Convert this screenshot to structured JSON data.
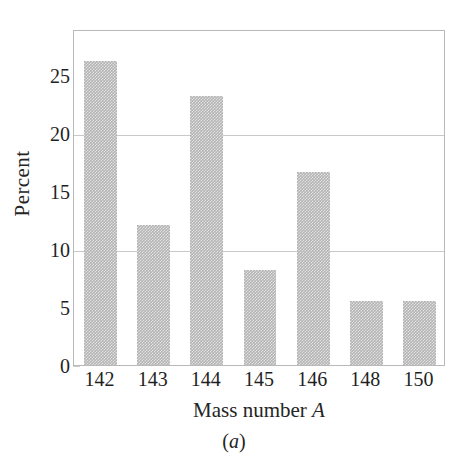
{
  "chart_data": {
    "type": "bar",
    "title": "",
    "subtitle": "",
    "categories": [
      "142",
      "143",
      "144",
      "145",
      "146",
      "148",
      "150"
    ],
    "values": [
      26.2,
      12.1,
      23.2,
      8.2,
      16.7,
      5.5,
      5.5
    ],
    "xlabel_text": "Mass number ",
    "xlabel_symbol": "A",
    "ylabel": "Percent",
    "ylim": [
      0,
      29
    ],
    "xlim": [
      0,
      7
    ],
    "yticks": [
      0,
      5,
      10,
      15,
      20,
      25
    ],
    "ytick_labels": [
      "0",
      "5",
      "10",
      "15",
      "20",
      "25"
    ],
    "gridlines": [
      10,
      20
    ],
    "grid": true,
    "legend": "none",
    "bar_color": "#b4b4b4",
    "frame_color": "#b9b9b9",
    "grid_color": "#d9d9d9",
    "text_color": "#1f1f1f",
    "bar_width_fraction": 0.62
  },
  "caption": {
    "prefix": "(",
    "letter": "a",
    "suffix": ")"
  }
}
